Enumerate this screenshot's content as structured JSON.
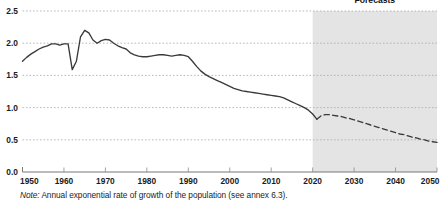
{
  "chart_data": {
    "type": "line",
    "title": "",
    "subtitle": "",
    "xlabel": "",
    "ylabel": "",
    "xlim": [
      1950,
      2050
    ],
    "ylim": [
      0.0,
      2.5
    ],
    "grid": true,
    "grid_axis": "y",
    "legend_position": "none",
    "x_ticks": [
      "1950",
      "1960",
      "1970",
      "1980",
      "1990",
      "2000",
      "2010",
      "2020",
      "2030",
      "2040",
      "2050"
    ],
    "x_tick_values": [
      1950,
      1960,
      1970,
      1980,
      1990,
      2000,
      2010,
      2020,
      2030,
      2040,
      2050
    ],
    "y_ticks": [
      "0.0",
      "0.5",
      "1.0",
      "1.5",
      "2.0",
      "2.5"
    ],
    "y_tick_values": [
      0.0,
      0.5,
      1.0,
      1.5,
      2.0,
      2.5
    ],
    "annotations": [
      {
        "name": "forecasts-label",
        "text": "Forecasts",
        "x": 2035,
        "y": 2.62
      }
    ],
    "shaded_regions": [
      {
        "name": "forecast-band",
        "x_start": 2020,
        "x_end": 2050,
        "color": "#e4e4e4",
        "label": "Forecasts"
      }
    ],
    "series": [
      {
        "name": "Observed annual growth rate",
        "style": "solid",
        "color": "#3a3a3a",
        "x": [
          1950,
          1951,
          1952,
          1953,
          1954,
          1955,
          1956,
          1957,
          1958,
          1959,
          1960,
          1961,
          1962,
          1963,
          1964,
          1965,
          1966,
          1967,
          1968,
          1969,
          1970,
          1971,
          1972,
          1973,
          1974,
          1975,
          1976,
          1977,
          1978,
          1979,
          1980,
          1981,
          1982,
          1983,
          1984,
          1985,
          1986,
          1987,
          1988,
          1989,
          1990,
          1991,
          1992,
          1993,
          1994,
          1995,
          1996,
          1997,
          1998,
          1999,
          2000,
          2001,
          2002,
          2003,
          2004,
          2005,
          2006,
          2007,
          2008,
          2009,
          2010,
          2011,
          2012,
          2013,
          2014,
          2015,
          2016,
          2017,
          2018,
          2019,
          2020,
          2021
        ],
        "y": [
          1.72,
          1.78,
          1.83,
          1.87,
          1.91,
          1.94,
          1.96,
          1.99,
          1.99,
          1.97,
          1.99,
          1.99,
          1.59,
          1.72,
          2.1,
          2.2,
          2.16,
          2.05,
          2.0,
          2.04,
          2.06,
          2.05,
          2.0,
          1.96,
          1.93,
          1.91,
          1.85,
          1.82,
          1.8,
          1.79,
          1.79,
          1.8,
          1.81,
          1.82,
          1.82,
          1.81,
          1.8,
          1.81,
          1.82,
          1.81,
          1.79,
          1.72,
          1.64,
          1.57,
          1.52,
          1.48,
          1.45,
          1.42,
          1.39,
          1.36,
          1.33,
          1.3,
          1.28,
          1.26,
          1.25,
          1.24,
          1.23,
          1.22,
          1.21,
          1.2,
          1.19,
          1.18,
          1.17,
          1.15,
          1.12,
          1.09,
          1.06,
          1.03,
          1.0,
          0.96,
          0.9,
          0.82
        ]
      },
      {
        "name": "Projected annual growth rate",
        "style": "dashed",
        "color": "#3a3a3a",
        "x": [
          2021,
          2022,
          2023,
          2024,
          2025,
          2026,
          2027,
          2028,
          2029,
          2030,
          2031,
          2032,
          2033,
          2034,
          2035,
          2036,
          2037,
          2038,
          2039,
          2040,
          2041,
          2042,
          2043,
          2044,
          2045,
          2046,
          2047,
          2048,
          2049,
          2050
        ],
        "y": [
          0.82,
          0.87,
          0.89,
          0.89,
          0.88,
          0.87,
          0.86,
          0.84,
          0.83,
          0.81,
          0.79,
          0.77,
          0.75,
          0.73,
          0.71,
          0.69,
          0.67,
          0.65,
          0.63,
          0.61,
          0.59,
          0.58,
          0.56,
          0.54,
          0.53,
          0.51,
          0.5,
          0.48,
          0.47,
          0.46
        ]
      }
    ]
  },
  "note": {
    "lead": "Note:",
    "body": " Annual exponential rate of growth of the population (see annex 6.3)."
  }
}
